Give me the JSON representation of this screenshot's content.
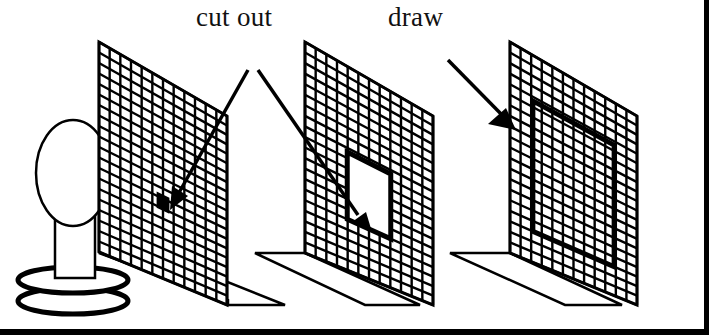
{
  "figure": {
    "labels": {
      "cut_out": "cut out",
      "draw": "draw"
    },
    "panels": [
      {
        "id": "panel-1",
        "feature": "small cut-out hole",
        "grid_cols": 12,
        "grid_rows": 20
      },
      {
        "id": "panel-2",
        "feature": "large cut-out window",
        "grid_cols": 12,
        "grid_rows": 20
      },
      {
        "id": "panel-3",
        "feature": "drawn rectangle outline",
        "grid_cols": 12,
        "grid_rows": 20
      }
    ],
    "light_source": "lamp on stand",
    "colors": {
      "ink": "#000000",
      "paper": "#ffffff"
    }
  }
}
